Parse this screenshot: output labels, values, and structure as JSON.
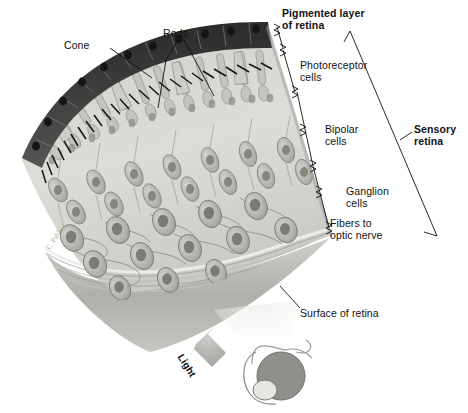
{
  "figure": {
    "type": "anatomical-illustration",
    "background_color": "#ffffff",
    "text_color": "#111111"
  },
  "labels": {
    "cone": "Cone",
    "rods": "Rods",
    "pigmented_layer": "Pigmented layer\nof retina",
    "photoreceptor_cells": "Photoreceptor\ncells",
    "bipolar_cells": "Bipolar\ncells",
    "ganglion_cells": "Ganglion\ncells",
    "fibers_to_optic_nerve": "Fibers to\noptic nerve",
    "sensory_retina": "Sensory\nretina",
    "surface_of_retina": "Surface of retina",
    "light": "Light",
    "artist_signature": "C. Publ..."
  },
  "structures": [
    {
      "name": "pigmented-epithelium-layer",
      "description": "dark band of cuboidal pigment cells with nuclei along curved upper edge",
      "color": "#3a3a3a"
    },
    {
      "name": "photoreceptor-layer",
      "description": "rod and cone outer segments with microvilli",
      "color": "#b9b9b4"
    },
    {
      "name": "bipolar-cell-layer",
      "description": "spindle shaped bipolar neurons with round nuclei",
      "color": "#c9c9c4"
    },
    {
      "name": "ganglion-cell-layer",
      "description": "large pear shaped ganglion neurons with axons",
      "color": "#bdbdb8"
    },
    {
      "name": "nerve-fiber-layer",
      "description": "striped banding at lower cut edge",
      "color": "#d8d8d3"
    },
    {
      "name": "retina-under-surface",
      "description": "smooth gray inner surface of the retina block",
      "color": "#b5b5b0"
    },
    {
      "name": "light-arrow",
      "description": "broad gray arrow pointing up toward retina surface",
      "color": "#9a9a96"
    },
    {
      "name": "eyeball-inset",
      "description": "small sketch of the eyeball with cornea, linked to retina surface by a cone of light",
      "color": "#8e8e8a"
    }
  ],
  "brackets": [
    {
      "name": "pigmented-layer-bracket",
      "spans": "Pigmented layer of retina"
    },
    {
      "name": "photoreceptor-bracket",
      "spans": "Photoreceptor cells"
    },
    {
      "name": "bipolar-bracket",
      "spans": "Bipolar cells"
    },
    {
      "name": "ganglion-bracket",
      "spans": "Ganglion cells"
    },
    {
      "name": "fibers-bracket",
      "spans": "Fibers to optic nerve"
    },
    {
      "name": "sensory-retina-bracket",
      "spans": "Sensory retina"
    }
  ]
}
